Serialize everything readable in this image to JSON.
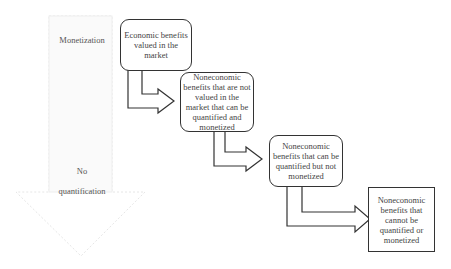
{
  "diagram": {
    "big_arrow": {
      "top_label": "Monetization",
      "bottom_label_1": "No",
      "bottom_label_2": "quantification"
    },
    "boxes": [
      {
        "label": "Economic benefits valued in the market",
        "shape": "rounded"
      },
      {
        "label": "Noneconomic benefits that are not valued in the market that can be quantified and monetized",
        "shape": "rounded"
      },
      {
        "label": "Noneconomic benefits that can be quantified but not monetized",
        "shape": "rounded"
      },
      {
        "label": "Noneconomic benefits that cannot be quantified or monetized",
        "shape": "square"
      }
    ]
  }
}
